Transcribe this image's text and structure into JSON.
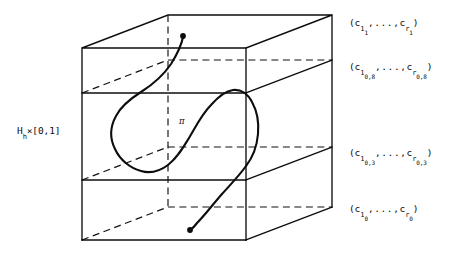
{
  "figure": {
    "kind": "mathematical-diagram",
    "background_color": "#ffffff",
    "ink_color": "#0d0d0d"
  },
  "labels": {
    "left_side": {
      "base": "H",
      "sub": "h",
      "rest": "×[0,1]",
      "full_text": "H_h×[0,1]"
    },
    "pi": "π",
    "levels": [
      {
        "id": "level-1",
        "open_paren": "(c",
        "first_sub": "1",
        "first_sub_sub": "1",
        "dots": ",...,",
        "second": "c",
        "second_sub": "r",
        "second_sub_sub": "1",
        "close_paren": ")",
        "full_text": "(c_1_1,...,c_r_1)"
      },
      {
        "id": "level-0.8",
        "open_paren": "(c",
        "first_sub": "1",
        "first_sub_sub": "0,8",
        "dots": ",...,",
        "second": "c",
        "second_sub": "r",
        "second_sub_sub": "0,8",
        "close_paren": ")",
        "full_text": "(c_1_0,8,...,c_r_0,8)"
      },
      {
        "id": "level-0.3",
        "open_paren": "(c",
        "first_sub": "1",
        "first_sub_sub": "0,3",
        "dots": ",...,",
        "second": "c",
        "second_sub": "r",
        "second_sub_sub": "0,3",
        "close_paren": ")",
        "full_text": "(c_1_0,3,...,c_r_0,3)"
      },
      {
        "id": "level-0",
        "open_paren": "(c",
        "first_sub": "1",
        "first_sub_sub": "0",
        "dots": ",...,",
        "second": "c",
        "second_sub": "r",
        "second_sub_sub": "0",
        "close_paren": ")",
        "full_text": "(c_1_0,...,c_r_0)"
      }
    ]
  },
  "geometry": {
    "front_face": {
      "left_x": 82,
      "right_x": 246,
      "top_y": 48,
      "bottom_y": 240
    },
    "depth_offset": {
      "dx": 86,
      "dy": -33
    },
    "slice_front_y": [
      48,
      93,
      180,
      240
    ],
    "endpoints": {
      "top_dot": {
        "x": 183,
        "y": 36
      },
      "bottom_dot": {
        "x": 190,
        "y": 230
      }
    }
  }
}
